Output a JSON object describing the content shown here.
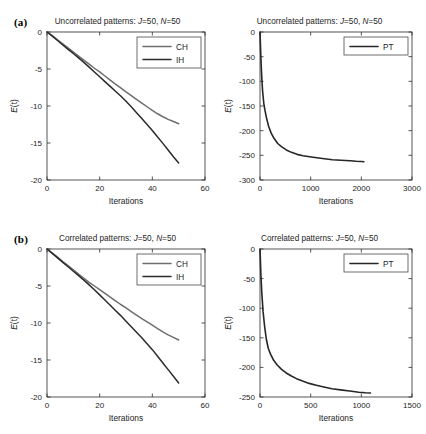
{
  "figure": {
    "background": "#ffffff",
    "panels": [
      {
        "tag": "(a)",
        "condition": "Uncorrelated patterns",
        "charts": [
          {
            "id": "a-left",
            "chart_ref": 0
          },
          {
            "id": "a-right",
            "chart_ref": 1
          }
        ]
      },
      {
        "tag": "(b)",
        "condition": "Correlated patterns",
        "charts": [
          {
            "id": "b-left",
            "chart_ref": 2
          },
          {
            "id": "b-right",
            "chart_ref": 3
          }
        ]
      }
    ]
  },
  "titles": {
    "a_left": "Uncorrelated patterns: J=50, N=50",
    "a_right": "Uncorrelated patterns: J=50, N=50",
    "b_left": "Correlated patterns: J=50, N=50",
    "b_right": "Correlated patterns: J=50, N=50",
    "prefix_uncorrelated": "Uncorrelated patterns:",
    "prefix_correlated": "Correlated patterns:",
    "param_j_symbol": "J",
    "param_j_value": "=50,",
    "param_n_symbol": "N",
    "param_n_value": "=50"
  },
  "labels": {
    "xlabel": "Iterations",
    "ylabel_symbol": "E",
    "ylabel_arg": "(t)",
    "tag_a": "(a)",
    "tag_b": "(b)"
  },
  "colors": {
    "ch": "#6e6e6e",
    "ih": "#2b2b2b",
    "pt": "#262626",
    "axis": "#2b2b2b",
    "text": "#1d1d1d",
    "legend_border": "#4a4a4a",
    "background": "#ffffff"
  },
  "chart_data": [
    {
      "type": "line",
      "id": "a-left",
      "title": "Uncorrelated patterns: J=50, N=50",
      "xlabel": "Iterations",
      "ylabel": "E(t)",
      "xlim": [
        0,
        60
      ],
      "ylim": [
        -20,
        0
      ],
      "xticks": [
        0,
        20,
        40,
        60
      ],
      "yticks": [
        0,
        -5,
        -10,
        -15,
        -20
      ],
      "xticklabels": [
        "0",
        "20",
        "40",
        "60"
      ],
      "yticklabels": [
        "0",
        "-5",
        "-10",
        "-15",
        "-20"
      ],
      "grid": false,
      "legend": [
        "CH",
        "IH"
      ],
      "legend_position": "upper right",
      "series": [
        {
          "name": "CH",
          "color": "#6e6e6e",
          "x": [
            0,
            2,
            4,
            6,
            8,
            10,
            12,
            14,
            16,
            18,
            20,
            22,
            24,
            26,
            28,
            30,
            32,
            34,
            36,
            38,
            40,
            42,
            44,
            46,
            48,
            50
          ],
          "values": [
            0,
            -0.5,
            -1.05,
            -1.6,
            -2.15,
            -2.7,
            -3.25,
            -3.8,
            -4.35,
            -4.9,
            -5.4,
            -5.95,
            -6.5,
            -7.05,
            -7.55,
            -8.1,
            -8.6,
            -9.1,
            -9.6,
            -10.1,
            -10.6,
            -11.05,
            -11.45,
            -11.8,
            -12.1,
            -12.4
          ]
        },
        {
          "name": "IH",
          "color": "#2b2b2b",
          "x": [
            0,
            2,
            4,
            6,
            8,
            10,
            12,
            14,
            16,
            18,
            20,
            22,
            24,
            26,
            28,
            30,
            32,
            34,
            36,
            38,
            40,
            42,
            44,
            46,
            48,
            50
          ],
          "values": [
            0,
            -0.55,
            -1.15,
            -1.75,
            -2.35,
            -2.9,
            -3.5,
            -4.1,
            -4.75,
            -5.4,
            -6.05,
            -6.7,
            -7.35,
            -8.0,
            -8.65,
            -9.35,
            -10.1,
            -10.9,
            -11.7,
            -12.5,
            -13.3,
            -14.2,
            -15.05,
            -15.95,
            -16.85,
            -17.7
          ]
        }
      ]
    },
    {
      "type": "line",
      "id": "a-right",
      "title": "Uncorrelated patterns: J=50, N=50",
      "xlabel": "Iterations",
      "ylabel": "E(t)",
      "xlim": [
        0,
        3000
      ],
      "ylim": [
        -300,
        0
      ],
      "xticks": [
        0,
        1000,
        2000,
        3000
      ],
      "yticks": [
        0,
        -50,
        -100,
        -150,
        -200,
        -250,
        -300
      ],
      "xticklabels": [
        "0",
        "1000",
        "2000",
        "3000"
      ],
      "yticklabels": [
        "0",
        "-50",
        "-100",
        "-150",
        "-200",
        "-250",
        "-300"
      ],
      "grid": false,
      "legend": [
        "PT"
      ],
      "legend_position": "upper right",
      "series": [
        {
          "name": "PT",
          "color": "#262626",
          "x": [
            0,
            15,
            30,
            50,
            75,
            100,
            130,
            170,
            220,
            280,
            350,
            430,
            520,
            620,
            730,
            850,
            980,
            1120,
            1270,
            1430,
            1600,
            1780,
            1900,
            2000,
            2050
          ],
          "values": [
            0,
            -45,
            -82,
            -118,
            -145,
            -160,
            -175,
            -191,
            -205,
            -216,
            -226,
            -233,
            -239,
            -244,
            -248,
            -251,
            -253,
            -255,
            -257,
            -259,
            -260,
            -261,
            -262,
            -262.5,
            -263
          ]
        }
      ]
    },
    {
      "type": "line",
      "id": "b-left",
      "title": "Correlated patterns: J=50, N=50",
      "xlabel": "Iterations",
      "ylabel": "E(t)",
      "xlim": [
        0,
        60
      ],
      "ylim": [
        -20,
        0
      ],
      "xticks": [
        0,
        20,
        40,
        60
      ],
      "yticks": [
        0,
        -5,
        -10,
        -15,
        -20
      ],
      "xticklabels": [
        "0",
        "20",
        "40",
        "60"
      ],
      "yticklabels": [
        "0",
        "-5",
        "-10",
        "-15",
        "-20"
      ],
      "grid": false,
      "legend": [
        "CH",
        "IH"
      ],
      "legend_position": "upper right",
      "series": [
        {
          "name": "CH",
          "color": "#6e6e6e",
          "x": [
            0,
            2,
            4,
            6,
            8,
            10,
            12,
            14,
            16,
            18,
            20,
            22,
            24,
            26,
            28,
            30,
            32,
            34,
            36,
            38,
            40,
            42,
            44,
            46,
            48,
            50
          ],
          "values": [
            0,
            -0.55,
            -1.1,
            -1.7,
            -2.25,
            -2.8,
            -3.4,
            -3.95,
            -4.5,
            -5.0,
            -5.5,
            -6.0,
            -6.5,
            -7.0,
            -7.5,
            -7.95,
            -8.45,
            -8.95,
            -9.4,
            -9.85,
            -10.3,
            -10.75,
            -11.2,
            -11.6,
            -11.95,
            -12.3
          ]
        },
        {
          "name": "IH",
          "color": "#2b2b2b",
          "x": [
            0,
            2,
            4,
            6,
            8,
            10,
            12,
            14,
            16,
            18,
            20,
            22,
            24,
            26,
            28,
            30,
            32,
            34,
            36,
            38,
            40,
            42,
            44,
            46,
            48,
            50
          ],
          "values": [
            0,
            -0.6,
            -1.2,
            -1.8,
            -2.4,
            -3.0,
            -3.6,
            -4.2,
            -4.85,
            -5.5,
            -6.2,
            -6.9,
            -7.6,
            -8.3,
            -9.0,
            -9.75,
            -10.5,
            -11.25,
            -12.0,
            -12.8,
            -13.6,
            -14.5,
            -15.4,
            -16.3,
            -17.2,
            -18.1
          ]
        }
      ]
    },
    {
      "type": "line",
      "id": "b-right",
      "title": "Correlated patterns: J=50, N=50",
      "xlabel": "Iterations",
      "ylabel": "E(t)",
      "xlim": [
        0,
        1500
      ],
      "ylim": [
        -250,
        0
      ],
      "xticks": [
        0,
        500,
        1000,
        1500
      ],
      "yticks": [
        0,
        -50,
        -100,
        -150,
        -200,
        -250
      ],
      "xticklabels": [
        "0",
        "500",
        "1000",
        "1500"
      ],
      "yticklabels": [
        "0",
        "-50",
        "-100",
        "-150",
        "-200",
        "-250"
      ],
      "grid": false,
      "legend": [
        "PT"
      ],
      "legend_position": "upper right",
      "series": [
        {
          "name": "PT",
          "color": "#262626",
          "x": [
            0,
            8,
            18,
            30,
            45,
            62,
            82,
            105,
            135,
            170,
            210,
            255,
            305,
            360,
            420,
            485,
            555,
            630,
            710,
            795,
            885,
            975,
            1040,
            1090
          ],
          "values": [
            0,
            -40,
            -75,
            -105,
            -130,
            -152,
            -168,
            -178,
            -188,
            -196,
            -203,
            -209,
            -214,
            -219,
            -223,
            -227,
            -230,
            -233,
            -236,
            -238,
            -240,
            -242,
            -242.8,
            -243.2
          ]
        }
      ]
    }
  ]
}
